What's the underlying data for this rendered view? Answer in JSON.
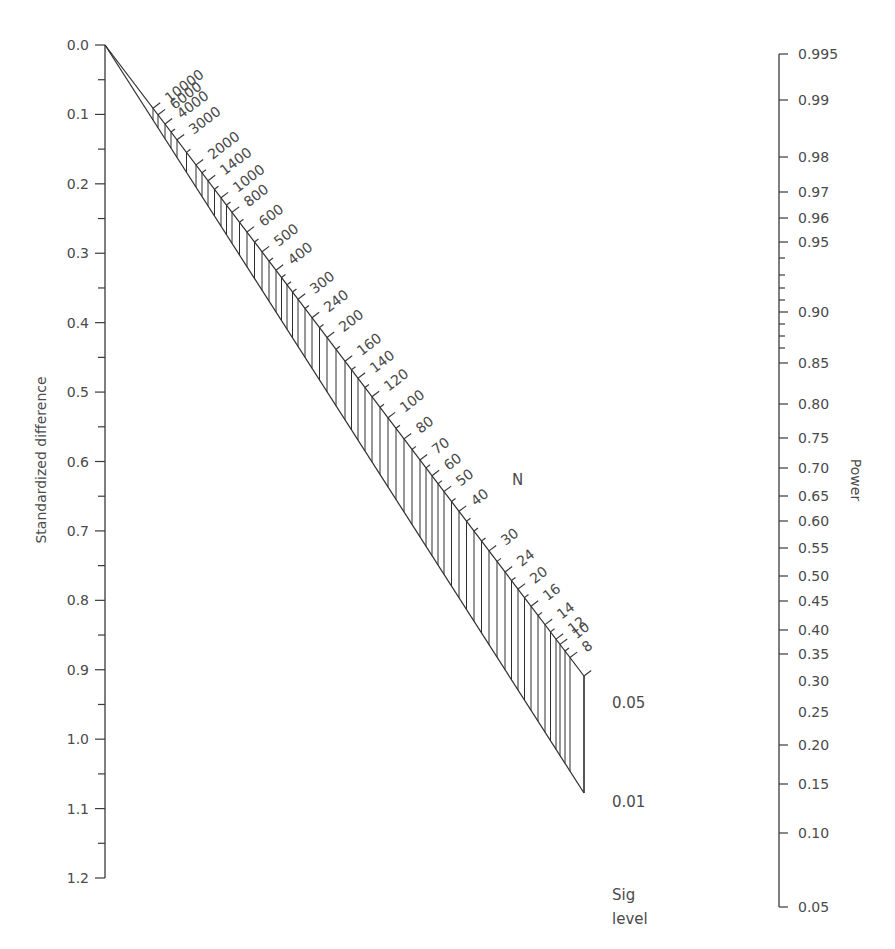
{
  "chart_data": {
    "type": "nomogram",
    "title": "",
    "left_axis": {
      "label": "Standardized difference",
      "ticks": [
        "0.0",
        "0.1",
        "0.2",
        "0.3",
        "0.4",
        "0.5",
        "0.6",
        "0.7",
        "0.8",
        "0.9",
        "1.0",
        "1.1",
        "1.2"
      ],
      "values": [
        0.0,
        0.1,
        0.2,
        0.3,
        0.4,
        0.5,
        0.6,
        0.7,
        0.8,
        0.9,
        1.0,
        1.1,
        1.2
      ],
      "minor_ticks": [
        0.05,
        0.15,
        0.25,
        0.35,
        0.45,
        0.55,
        0.65,
        0.75,
        0.85,
        0.95,
        1.05,
        1.15
      ],
      "range": [
        0.0,
        1.2
      ]
    },
    "n_scale": {
      "label": "N",
      "ticks": [
        "10000",
        "6000",
        "4000",
        "3000",
        "2000",
        "1400",
        "1000",
        "800",
        "600",
        "500",
        "400",
        "300",
        "240",
        "200",
        "160",
        "140",
        "120",
        "100",
        "80",
        "70",
        "60",
        "50",
        "40",
        "30",
        "24",
        "20",
        "16",
        "14",
        "12",
        "10",
        "8"
      ],
      "tick_x": [
        153,
        158,
        165,
        177,
        196,
        208,
        221,
        232,
        247,
        262,
        276,
        298,
        312,
        327,
        345,
        358,
        372,
        388,
        404,
        420,
        432,
        444,
        459,
        489,
        505,
        518,
        531,
        545,
        556,
        560,
        570
      ]
    },
    "sig_level": {
      "label_line1": "Sig",
      "label_line2": "level",
      "values": [
        "0.05",
        "0.01"
      ]
    },
    "right_axis": {
      "label": "Power",
      "labels": [
        {
          "text": "0.995",
          "y": 54,
          "tick": true
        },
        {
          "text": "0.99",
          "y": 100,
          "tick": true
        },
        {
          "text": "0.98",
          "y": 157,
          "tick": true
        },
        {
          "text": "0.97",
          "y": 192,
          "tick": true
        },
        {
          "text": "0.96",
          "y": 218,
          "tick": true
        },
        {
          "text": "0.95",
          "y": 242,
          "tick": true
        },
        {
          "text": "0.90",
          "y": 312,
          "tick": true
        },
        {
          "text": "0.85",
          "y": 363,
          "tick": true
        },
        {
          "text": "0.80",
          "y": 404,
          "tick": true
        },
        {
          "text": "0.75",
          "y": 438,
          "tick": true
        },
        {
          "text": "0.70",
          "y": 468,
          "tick": true
        },
        {
          "text": "0.65",
          "y": 496,
          "tick": true
        },
        {
          "text": "0.60",
          "y": 521,
          "tick": true
        },
        {
          "text": "0.55",
          "y": 548,
          "tick": true
        },
        {
          "text": "0.50",
          "y": 576,
          "tick": true
        },
        {
          "text": "0.45",
          "y": 601,
          "tick": true
        },
        {
          "text": "0.40",
          "y": 630,
          "tick": true
        },
        {
          "text": "0.35",
          "y": 654,
          "tick": true
        },
        {
          "text": "0.30",
          "y": 681,
          "tick": false
        },
        {
          "text": "0.25",
          "y": 712,
          "tick": false
        },
        {
          "text": "0.20",
          "y": 745,
          "tick": true
        },
        {
          "text": "0.15",
          "y": 784,
          "tick": true
        },
        {
          "text": "0.10",
          "y": 833,
          "tick": true
        },
        {
          "text": "0.05",
          "y": 907,
          "tick": true
        }
      ],
      "minor_tick_y": [
        258,
        275,
        288,
        300,
        324,
        336,
        348
      ]
    }
  }
}
